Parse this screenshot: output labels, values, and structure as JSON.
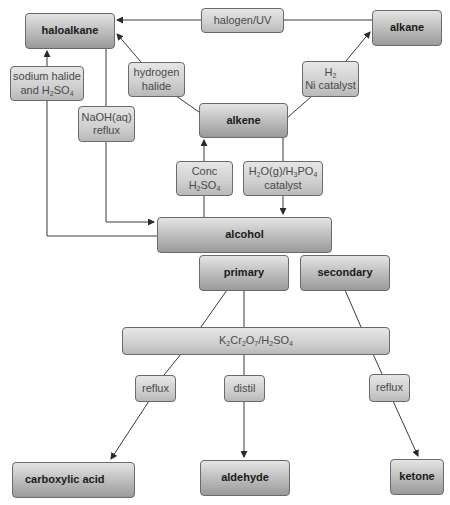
{
  "diagram": {
    "type": "reaction-scheme",
    "nodes": {
      "haloalkane": {
        "label": "haloalkane",
        "kind": "compound"
      },
      "alkane": {
        "label": "alkane",
        "kind": "compound"
      },
      "alkene": {
        "label": "alkene",
        "kind": "compound"
      },
      "alcohol": {
        "label": "alcohol",
        "kind": "compound"
      },
      "primary": {
        "label": "primary",
        "kind": "compound"
      },
      "secondary": {
        "label": "secondary",
        "kind": "compound"
      },
      "carboxylic_acid": {
        "label": "carboxylic acid",
        "kind": "compound"
      },
      "aldehyde": {
        "label": "aldehyde",
        "kind": "compound"
      },
      "ketone": {
        "label": "ketone",
        "kind": "compound"
      },
      "halogen_uv": {
        "label": "halogen/UV",
        "kind": "reagent"
      },
      "sodium_halide": {
        "line1": "sodium halide",
        "line2_pre": "and H",
        "line2_sub1": "2",
        "line2_mid": "SO",
        "line2_sub2": "4",
        "kind": "reagent"
      },
      "hydrogen_halide": {
        "line1": "hydrogen",
        "line2": "halide",
        "kind": "reagent"
      },
      "h2_ni": {
        "line1_pre": "H",
        "line1_sub": "2",
        "line2": "Ni catalyst",
        "kind": "reagent"
      },
      "naoh_reflux": {
        "line1": "NaOH(aq)",
        "line2": "reflux",
        "kind": "reagent"
      },
      "conc_h2so4": {
        "line1": "Conc",
        "line2_pre": "H",
        "line2_sub1": "2",
        "line2_mid": "SO",
        "line2_sub2": "4",
        "kind": "reagent"
      },
      "steam_h3po4": {
        "l1_a": "H",
        "l1_s1": "2",
        "l1_b": "O(g)/H",
        "l1_s2": "3",
        "l1_c": "PO",
        "l1_s3": "4",
        "line2": "catalyst",
        "kind": "reagent"
      },
      "dichromate": {
        "a": "K",
        "s1": "2",
        "b": "Cr",
        "s2": "2",
        "c": "O",
        "s3": "7",
        "d": "/H",
        "s4": "2",
        "e": "SO",
        "s5": "4",
        "kind": "reagent"
      },
      "reflux_left": {
        "label": "reflux",
        "kind": "reagent"
      },
      "distil": {
        "label": "distil",
        "kind": "reagent"
      },
      "reflux_right": {
        "label": "reflux",
        "kind": "reagent"
      }
    },
    "edges": [
      {
        "from": "alkane",
        "to": "haloalkane",
        "via": "halogen/UV"
      },
      {
        "from": "alkene",
        "to": "haloalkane",
        "via": "hydrogen halide"
      },
      {
        "from": "alkene",
        "to": "alkane",
        "via": "H2 Ni catalyst"
      },
      {
        "from": "alcohol",
        "to": "haloalkane",
        "via": "sodium halide and H2SO4"
      },
      {
        "from": "haloalkane",
        "to": "alcohol",
        "via": "NaOH(aq) reflux"
      },
      {
        "from": "alcohol",
        "to": "alkene",
        "via": "Conc H2SO4"
      },
      {
        "from": "alkene",
        "to": "alcohol",
        "via": "H2O(g)/H3PO4 catalyst"
      },
      {
        "from": "primary",
        "to": "carboxylic acid",
        "via": "K2Cr2O7/H2SO4 reflux"
      },
      {
        "from": "primary",
        "to": "aldehyde",
        "via": "K2Cr2O7/H2SO4 distil"
      },
      {
        "from": "secondary",
        "to": "ketone",
        "via": "K2Cr2O7/H2SO4 reflux"
      }
    ],
    "colors": {
      "line": "#3a3a3a",
      "border": "#6a6a6a",
      "compound_text": "#1a1a1a",
      "reagent_text": "#4a4a4a"
    }
  }
}
